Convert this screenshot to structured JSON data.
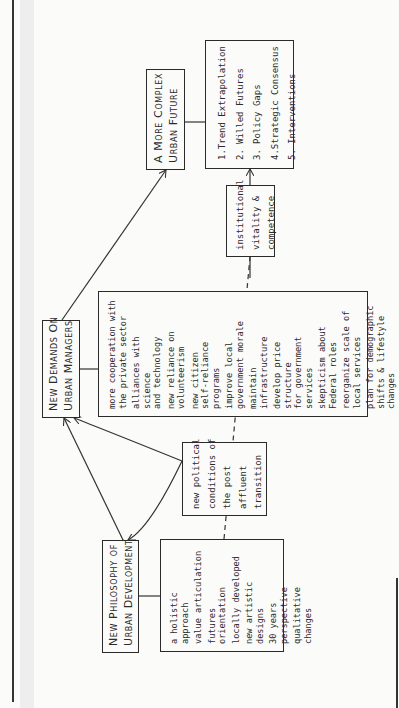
{
  "diagram": {
    "orientation": "rotated-90-counterclockwise",
    "nodes": {
      "philosophy": {
        "title": [
          "New Philosophy of",
          "Urban Development"
        ],
        "items": [
          "a holistic approach",
          "value articulation",
          "futures orientation",
          "locally developed",
          "new artistic\ndesigns",
          "30 years perspective",
          "qualitative changes"
        ]
      },
      "political": {
        "lines": [
          "new political",
          "conditions of",
          "the post",
          "affluent",
          "transition"
        ]
      },
      "demands": {
        "title": [
          "New Demands On",
          "Urban Managers"
        ],
        "items": [
          "more cooperation with\nthe private sector",
          "alliances with science\nand technology",
          "new reliance on\nvolunteerism",
          "new citizen\nself-reliance programs",
          "improve local\ngovernment morale",
          "maintain infrastructure",
          "develop price structure\nfor government services",
          "skepticism about\nFederal roles",
          "reorganize scale of\nlocal services",
          "plan for demographic\nshifts & lifestyle\nchanges"
        ]
      },
      "institutional": {
        "lines": [
          "institutional",
          "vitality &",
          "competence"
        ]
      },
      "future": {
        "title": [
          "A More Complex",
          "Urban Future"
        ],
        "items": [
          {
            "num": "1.",
            "label": "Trend Extrapolation"
          },
          {
            "num": "2.",
            "label": "Willed Futures"
          },
          {
            "num": "3.",
            "label": "Policy Gaps"
          },
          {
            "num": "4.",
            "label": "Strategic Consensus"
          },
          {
            "num": "5.",
            "label": "Interventions"
          }
        ]
      }
    },
    "edges": [
      {
        "from": "philosophy",
        "to": "demands",
        "style": "arrow-both"
      },
      {
        "from": "political",
        "to": "demands",
        "style": "curved-arrow"
      },
      {
        "from": "political",
        "to": "philosophy",
        "style": "curved-arrow"
      },
      {
        "from": "demands",
        "to": "future",
        "style": "arrow"
      },
      {
        "from": "institutional",
        "to": "future-list",
        "style": "arrow"
      },
      {
        "from": "philosophy-list",
        "to": "institutional",
        "style": "dashed"
      }
    ]
  }
}
